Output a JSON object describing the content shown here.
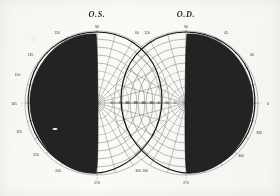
{
  "document": {
    "kind": "visual-field-perimetry-chart",
    "background_color": "#fbfaf7",
    "ink_color": "#232323"
  },
  "charts": [
    {
      "id": "os",
      "title": "O.S.",
      "center": {
        "x": 97,
        "y": 103
      },
      "radius": 72,
      "meridian_labels": [
        {
          "value": "90",
          "angle_deg": 90
        },
        {
          "value": "105",
          "angle_deg": 105
        },
        {
          "value": "120",
          "angle_deg": 120
        },
        {
          "value": "135",
          "angle_deg": 135
        },
        {
          "value": "150",
          "angle_deg": 150
        },
        {
          "value": "165",
          "angle_deg": 165
        },
        {
          "value": "180",
          "angle_deg": 180
        },
        {
          "value": "195",
          "angle_deg": 195
        },
        {
          "value": "210",
          "angle_deg": 210
        },
        {
          "value": "225",
          "angle_deg": 225
        },
        {
          "value": "240",
          "angle_deg": 240
        },
        {
          "value": "255",
          "angle_deg": 255
        },
        {
          "value": "270",
          "angle_deg": 270
        },
        {
          "value": "285",
          "angle_deg": 285
        },
        {
          "value": "300",
          "angle_deg": 300
        },
        {
          "value": "315",
          "angle_deg": 315
        },
        {
          "value": "330",
          "angle_deg": 330
        },
        {
          "value": "345",
          "angle_deg": 345
        },
        {
          "value": "0",
          "angle_deg": 0
        },
        {
          "value": "15",
          "angle_deg": 15
        },
        {
          "value": "30",
          "angle_deg": 30
        },
        {
          "value": "45",
          "angle_deg": 45
        },
        {
          "value": "60",
          "angle_deg": 60
        },
        {
          "value": "75",
          "angle_deg": 75
        }
      ],
      "eccentricity_rings_deg": [
        10,
        20,
        30,
        40,
        50,
        60,
        70,
        80,
        90
      ],
      "horizontal_scale_labels": [
        "80",
        "70",
        "60",
        "50",
        "40",
        "30",
        "20",
        "10"
      ],
      "defect_side": "left",
      "defect_label": "temporal field defect",
      "blind_spot_visible": true
    },
    {
      "id": "od",
      "title": "O.D.",
      "center": {
        "x": 186,
        "y": 103
      },
      "radius": 72,
      "meridian_labels": [
        {
          "value": "90",
          "angle_deg": 90
        },
        {
          "value": "105",
          "angle_deg": 105
        },
        {
          "value": "120",
          "angle_deg": 120
        },
        {
          "value": "135",
          "angle_deg": 135
        },
        {
          "value": "150",
          "angle_deg": 150
        },
        {
          "value": "165",
          "angle_deg": 165
        },
        {
          "value": "180",
          "angle_deg": 180
        },
        {
          "value": "195",
          "angle_deg": 195
        },
        {
          "value": "210",
          "angle_deg": 210
        },
        {
          "value": "225",
          "angle_deg": 225
        },
        {
          "value": "240",
          "angle_deg": 240
        },
        {
          "value": "255",
          "angle_deg": 255
        },
        {
          "value": "270",
          "angle_deg": 270
        },
        {
          "value": "285",
          "angle_deg": 285
        },
        {
          "value": "300",
          "angle_deg": 300
        },
        {
          "value": "315",
          "angle_deg": 315
        },
        {
          "value": "330",
          "angle_deg": 330
        },
        {
          "value": "345",
          "angle_deg": 345
        },
        {
          "value": "0",
          "angle_deg": 0
        },
        {
          "value": "15",
          "angle_deg": 15
        },
        {
          "value": "30",
          "angle_deg": 30
        },
        {
          "value": "45",
          "angle_deg": 45
        },
        {
          "value": "60",
          "angle_deg": 60
        },
        {
          "value": "75",
          "angle_deg": 75
        }
      ],
      "eccentricity_rings_deg": [
        10,
        20,
        30,
        40,
        50,
        60,
        70,
        80,
        90
      ],
      "horizontal_scale_labels": [
        "80",
        "70",
        "60",
        "50",
        "40",
        "30",
        "20",
        "10"
      ],
      "defect_side": "right",
      "defect_label": "temporal field defect",
      "blind_spot_visible": false
    }
  ],
  "labels": {
    "os_left_outer": [
      "135",
      "150",
      "165",
      "180",
      "195",
      "210",
      "240",
      "270",
      "300"
    ],
    "os_top": "90",
    "od_top": "90",
    "od_right_outer": [
      "45",
      "30",
      "0",
      "330",
      "300",
      "270",
      "240"
    ],
    "od_left_outer": [
      "120"
    ],
    "os_right_outer": [
      "60",
      "300"
    ]
  }
}
